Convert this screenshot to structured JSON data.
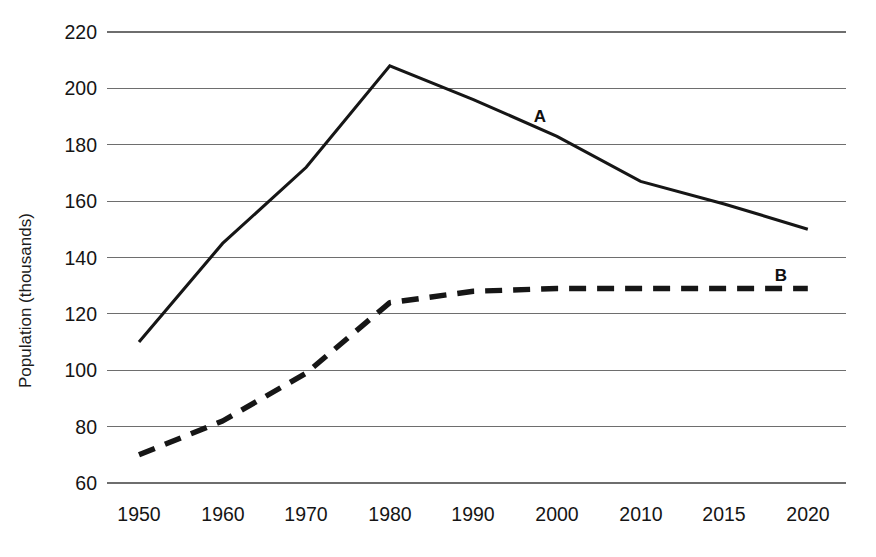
{
  "chart_data": {
    "type": "line",
    "title": "",
    "xlabel": "",
    "ylabel": "Population (thousands)",
    "categories": [
      "1950",
      "1960",
      "1970",
      "1980",
      "1990",
      "2000",
      "2010",
      "2015",
      "2020"
    ],
    "x": [
      1950,
      1960,
      1970,
      1980,
      1990,
      2000,
      2010,
      2015,
      2020
    ],
    "ylim": [
      60,
      220
    ],
    "yticks": [
      60,
      80,
      100,
      120,
      140,
      160,
      180,
      200,
      220
    ],
    "ytick_labels": [
      "60",
      "80",
      "100",
      "120",
      "140",
      "160",
      "180",
      "200",
      "220"
    ],
    "grid": "horizontal",
    "legend": "inline-labels",
    "series": [
      {
        "name": "A",
        "style": "solid",
        "label_text": "A",
        "values": [
          110,
          145,
          172,
          208,
          196,
          183,
          167,
          159,
          150
        ]
      },
      {
        "name": "B",
        "style": "dashed",
        "label_text": "B",
        "values": [
          70,
          82,
          99,
          124,
          128,
          129,
          129,
          129,
          129
        ]
      }
    ],
    "annotations": [
      {
        "text": "A",
        "near_x": "1990",
        "near_y": 192
      },
      {
        "text": "B",
        "near_x": "2015",
        "near_y": 134
      }
    ],
    "colors": {
      "series_a": "#161616",
      "series_b": "#161616",
      "gridline": "#6e6e6e",
      "text": "#151515",
      "background": "#ffffff"
    }
  }
}
